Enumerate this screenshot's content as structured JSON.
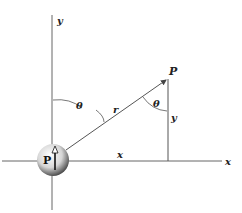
{
  "diagram": {
    "labels": {
      "y_axis": "y",
      "x_axis": "x",
      "point": "P",
      "theta_left": "θ",
      "theta_right": "θ",
      "radius": "r",
      "y_segment": "y",
      "x_segment": "x",
      "dipole": "P"
    },
    "colors": {
      "line": "#555555",
      "text": "#222222",
      "sphere_light": "#f4f4f4",
      "sphere_dark": "#555555"
    }
  }
}
